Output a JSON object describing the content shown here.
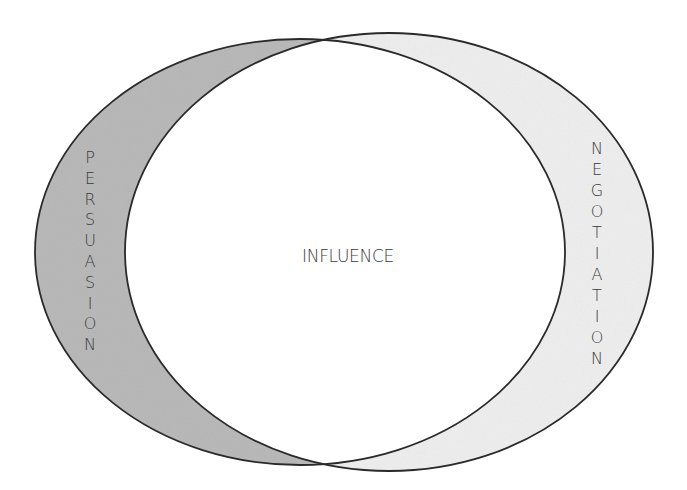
{
  "diagram": {
    "type": "overlapping-ellipses",
    "colors": {
      "persuasion_fill": "#b9b9b9",
      "negotiation_fill": "#eeeeee",
      "intersection_fill": "#ffffff",
      "stroke": "#2a2a2a",
      "text": "#3a3a3a"
    },
    "shapes": {
      "left_ellipse": {
        "cx": 300,
        "cy": 252,
        "rx": 265,
        "ry": 213
      },
      "right_ellipse": {
        "cx": 389,
        "cy": 252,
        "rx": 264,
        "ry": 219
      }
    },
    "labels": {
      "center": "INFLUENCE",
      "left": "PERSUASION",
      "right": "NEGOTIATION"
    },
    "label_letters": {
      "left": [
        "P",
        "E",
        "R",
        "S",
        "U",
        "A",
        "S",
        "I",
        "O",
        "N"
      ],
      "right": [
        "N",
        "E",
        "G",
        "O",
        "T",
        "I",
        "A",
        "T",
        "I",
        "O",
        "N"
      ]
    }
  }
}
